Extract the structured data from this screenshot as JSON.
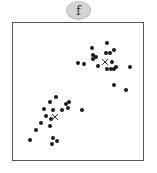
{
  "panel_label": "f",
  "chart_data": {
    "type": "scatter",
    "title": "",
    "xlabel": "",
    "ylabel": "",
    "grid": false,
    "axes_ticks": false,
    "point_color": "#1a1a1a",
    "centroid_marker": "x",
    "clusters": [
      {
        "name": "upper-right cluster",
        "centroid": [
          105,
          62
        ],
        "points": [
          [
            107,
            43
          ],
          [
            92,
            48
          ],
          [
            114,
            50
          ],
          [
            106,
            53
          ],
          [
            110,
            53
          ],
          [
            93,
            55
          ],
          [
            96,
            57
          ],
          [
            93,
            59
          ],
          [
            78,
            63
          ],
          [
            84,
            64
          ],
          [
            112,
            62
          ],
          [
            98,
            66
          ],
          [
            107,
            69
          ],
          [
            111,
            69
          ],
          [
            114,
            69
          ],
          [
            116,
            67
          ],
          [
            130,
            67
          ],
          [
            114,
            85
          ],
          [
            126,
            90
          ]
        ]
      },
      {
        "name": "lower-left cluster",
        "centroid": [
          55,
          117
        ],
        "points": [
          [
            56,
            97
          ],
          [
            50,
            102
          ],
          [
            69,
            102
          ],
          [
            66,
            104
          ],
          [
            44,
            109
          ],
          [
            53,
            110
          ],
          [
            62,
            110
          ],
          [
            68,
            108
          ],
          [
            82,
            110
          ],
          [
            46,
            116
          ],
          [
            51,
            119
          ],
          [
            41,
            123
          ],
          [
            50,
            126
          ],
          [
            36,
            130
          ],
          [
            30,
            140
          ],
          [
            53,
            138
          ],
          [
            57,
            141
          ],
          [
            52,
            144
          ]
        ]
      }
    ],
    "coordinate_note": "pixel positions within 157x173 image"
  }
}
